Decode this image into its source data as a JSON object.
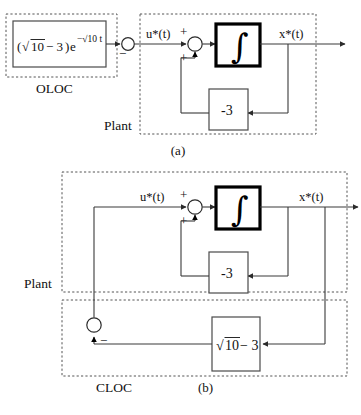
{
  "figure": {
    "title_hidden": "",
    "panels": [
      {
        "id": "a",
        "caption": "(a)",
        "controller": {
          "name": "OLOC",
          "formula_parts": {
            "open_paren": "(",
            "radical": "√",
            "radicand": "10",
            "minus_three": "− 3",
            "close_paren": ")",
            "base": "e",
            "exponent": "−√10 t",
            "full_text": "(√10 − 3)e^(−√10 t)"
          }
        },
        "plant": {
          "name": "Plant",
          "integrator_symbol": "∫",
          "gain_label": "-3"
        },
        "signals": {
          "input": "u*(t)",
          "output": "x*(t)"
        },
        "signs": {
          "junction_left": "−",
          "sum_top": "+",
          "sum_bottom": "+"
        }
      },
      {
        "id": "b",
        "caption": "(b)",
        "plant": {
          "name": "Plant",
          "integrator_symbol": "∫",
          "gain_label": "-3"
        },
        "controller": {
          "name": "CLOC",
          "gain_parts": {
            "radical": "√",
            "radicand": "10",
            "minus_three": "− 3",
            "full_text": "√10 − 3"
          }
        },
        "signals": {
          "input": "u*(t)",
          "output": "x*(t)"
        },
        "signs": {
          "sum_top": "+",
          "sum_bottom": "+",
          "feedback_minus": "−"
        }
      }
    ]
  },
  "colors": {
    "line": "#3a3a3a",
    "dashed": "#555555",
    "thick_border": "#000000",
    "background": "#ffffff",
    "text": "#111111"
  }
}
